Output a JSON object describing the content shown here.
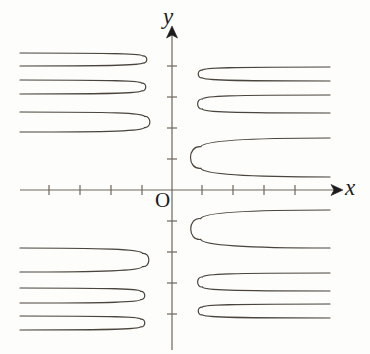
{
  "figure": {
    "title": "",
    "background_color": "#fdfdfb",
    "width": 370,
    "height": 354
  },
  "axes": {
    "x_axis_label": "x",
    "y_axis_label": "y",
    "origin_label": "O",
    "axis_color": "#6e675c",
    "tick_color": "#6e675c",
    "arrow_color": "#1c1c1c",
    "origin_px": {
      "x": 172,
      "y": 190
    },
    "unit_px": 31,
    "x_axis_extent_px": {
      "start": 20,
      "end": 341
    },
    "y_axis_extent_px": {
      "start": 28,
      "end": 350
    },
    "x_ticks_px": [
      49,
      80,
      111,
      142,
      202,
      233,
      264,
      295
    ],
    "y_ticks_px": [
      66,
      97,
      128,
      159,
      221,
      252,
      283,
      314
    ],
    "tick_half_length_px": 5,
    "tick_labels_shown": false,
    "grid": false
  },
  "chart_data": {
    "type": "line",
    "title": "",
    "xlabel": "x",
    "ylabel": "y",
    "grid": false,
    "legend": null,
    "axis_units_per_tick": 1,
    "xlim": [
      -4.9,
      5.45
    ],
    "ylim": [
      -5.16,
      5.23
    ],
    "curve_color": "#4a443c",
    "curve_width_px": 1.2,
    "series": [
      {
        "name": "branch-q2-1",
        "quadrant": "upper-left",
        "vertex_px": {
          "x": 143,
          "y": 59.5
        },
        "upper_asymptote_px": {
          "y": 53,
          "x_end": 20
        },
        "lower_asymptote_px": {
          "y": 66,
          "x_end": 20
        }
      },
      {
        "name": "branch-q2-2",
        "quadrant": "upper-left",
        "vertex_px": {
          "x": 142,
          "y": 87
        },
        "upper_asymptote_px": {
          "y": 80,
          "x_end": 20
        },
        "lower_asymptote_px": {
          "y": 94,
          "x_end": 20
        }
      },
      {
        "name": "branch-q2-3",
        "quadrant": "upper-left",
        "vertex_px": {
          "x": 145,
          "y": 122
        },
        "upper_asymptote_px": {
          "y": 112,
          "x_end": 20
        },
        "lower_asymptote_px": {
          "y": 132,
          "x_end": 20
        }
      },
      {
        "name": "branch-q1-1",
        "quadrant": "upper-right",
        "vertex_px": {
          "x": 202,
          "y": 74
        },
        "upper_asymptote_px": {
          "y": 67,
          "x_end": 330
        },
        "lower_asymptote_px": {
          "y": 81,
          "x_end": 330
        }
      },
      {
        "name": "branch-q1-2",
        "quadrant": "upper-right",
        "vertex_px": {
          "x": 202,
          "y": 104
        },
        "upper_asymptote_px": {
          "y": 95,
          "x_end": 330
        },
        "lower_asymptote_px": {
          "y": 113,
          "x_end": 330
        }
      },
      {
        "name": "branch-q1-3",
        "quadrant": "upper-right",
        "vertex_px": {
          "x": 200,
          "y": 157
        },
        "upper_asymptote_px": {
          "y": 138,
          "x_end": 330
        },
        "lower_asymptote_px": {
          "y": 177,
          "x_end": 330
        }
      },
      {
        "name": "branch-q3-1",
        "quadrant": "lower-left",
        "vertex_px": {
          "x": 143,
          "y": 260
        },
        "upper_asymptote_px": {
          "y": 248,
          "x_end": 20
        },
        "lower_asymptote_px": {
          "y": 272,
          "x_end": 20
        }
      },
      {
        "name": "branch-q3-2",
        "quadrant": "lower-left",
        "vertex_px": {
          "x": 141,
          "y": 295.5
        },
        "upper_asymptote_px": {
          "y": 288,
          "x_end": 20
        },
        "lower_asymptote_px": {
          "y": 303,
          "x_end": 20
        }
      },
      {
        "name": "branch-q3-3",
        "quadrant": "lower-left",
        "vertex_px": {
          "x": 141,
          "y": 323
        },
        "upper_asymptote_px": {
          "y": 316,
          "x_end": 20
        },
        "lower_asymptote_px": {
          "y": 330,
          "x_end": 20
        }
      },
      {
        "name": "branch-q4-1",
        "quadrant": "lower-right",
        "vertex_px": {
          "x": 200,
          "y": 229
        },
        "upper_asymptote_px": {
          "y": 210,
          "x_end": 330
        },
        "lower_asymptote_px": {
          "y": 248,
          "x_end": 330
        }
      },
      {
        "name": "branch-q4-2",
        "quadrant": "lower-right",
        "vertex_px": {
          "x": 202,
          "y": 282
        },
        "upper_asymptote_px": {
          "y": 273,
          "x_end": 330
        },
        "lower_asymptote_px": {
          "y": 291,
          "x_end": 330
        }
      },
      {
        "name": "branch-q4-3",
        "quadrant": "lower-right",
        "vertex_px": {
          "x": 202,
          "y": 311
        },
        "upper_asymptote_px": {
          "y": 304,
          "x_end": 330
        },
        "lower_asymptote_px": {
          "y": 318,
          "x_end": 330
        }
      }
    ]
  }
}
